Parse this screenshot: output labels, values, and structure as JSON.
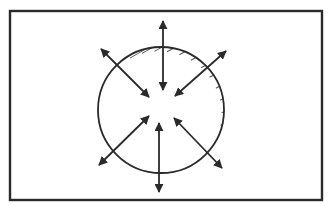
{
  "diagram": {
    "type": "radial-arrows-sphere",
    "background": "#ffffff",
    "stroke_color": "#2a2a2a",
    "frame": {
      "x": 10,
      "y": 11,
      "width": 312,
      "height": 189,
      "stroke_width": 2.4
    },
    "circle": {
      "cx": 161,
      "cy": 110,
      "r": 63,
      "stroke_width": 1.8,
      "shaded_side": "left"
    },
    "hatch": {
      "count": 15,
      "color": "#3a3a3a"
    },
    "arrows": [
      {
        "name": "top",
        "x1": 163,
        "y1": 21,
        "x2": 163,
        "y2": 90
      },
      {
        "name": "bottom",
        "x1": 159,
        "y1": 123,
        "x2": 159,
        "y2": 192
      },
      {
        "name": "upper-left",
        "x1": 101,
        "y1": 49,
        "x2": 149,
        "y2": 97
      },
      {
        "name": "upper-right",
        "x1": 226,
        "y1": 51,
        "x2": 175,
        "y2": 96
      },
      {
        "name": "lower-left",
        "x1": 99,
        "y1": 165,
        "x2": 149,
        "y2": 116
      },
      {
        "name": "lower-right",
        "x1": 222,
        "y1": 168,
        "x2": 174,
        "y2": 118
      }
    ]
  }
}
